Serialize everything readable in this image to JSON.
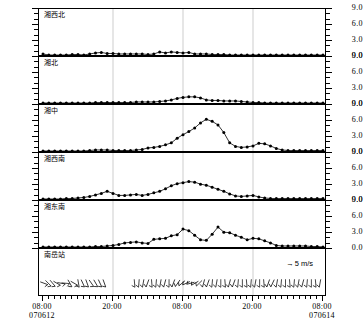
{
  "chart_data": {
    "type": "line",
    "title": "",
    "subtitle": "",
    "xlabel": "",
    "ylabel": "",
    "ylim": [
      0.0,
      9.0
    ],
    "yticks": [
      "0.0",
      "3.0",
      "6.0",
      "9.0"
    ],
    "grid": false,
    "legend_position": "panel-6-top-right",
    "x_tick_labels": [
      {
        "time": "08:00",
        "date": "070612"
      },
      {
        "time": "20:00",
        "date": ""
      },
      {
        "time": "08:00",
        "date": ""
      },
      {
        "time": "20:00",
        "date": ""
      },
      {
        "time": "08:00",
        "date": "070614"
      }
    ],
    "x_start": "070612 08:00",
    "x_end": "070614 08:00",
    "n_points": 49,
    "series": [
      {
        "name": "湘西北",
        "panel": 1,
        "values": [
          0.2,
          0.0,
          0.0,
          0.0,
          0.0,
          0.1,
          0.1,
          0.0,
          0.2,
          0.4,
          0.5,
          0.3,
          0.3,
          0.2,
          0.2,
          0.2,
          0.2,
          0.2,
          0.1,
          0.2,
          0.6,
          0.4,
          0.6,
          0.5,
          0.4,
          0.5,
          0.2,
          0.2,
          0.2,
          0.1,
          0.1,
          0.1,
          0.0,
          0.0,
          0.0,
          0.0,
          0.0,
          0.0,
          0.0,
          0.0,
          0.0,
          0.0,
          0.0,
          0.0,
          0.0,
          0.0,
          0.0,
          0.0,
          0.0
        ]
      },
      {
        "name": "湘北",
        "panel": 2,
        "values": [
          0.0,
          0.0,
          0.0,
          0.0,
          0.0,
          0.0,
          0.0,
          0.0,
          0.0,
          0.1,
          0.1,
          0.1,
          0.1,
          0.1,
          0.1,
          0.1,
          0.2,
          0.2,
          0.2,
          0.2,
          0.3,
          0.4,
          0.6,
          0.9,
          1.1,
          1.2,
          1.2,
          1.0,
          0.6,
          0.5,
          0.5,
          0.4,
          0.4,
          0.4,
          0.3,
          0.2,
          0.1,
          0.1,
          0.0,
          0.0,
          0.0,
          0.0,
          0.0,
          0.0,
          0.0,
          0.0,
          0.0,
          0.0,
          0.0
        ]
      },
      {
        "name": "湘中",
        "panel": 3,
        "values": [
          0.0,
          0.0,
          0.0,
          0.0,
          0.0,
          0.0,
          0.0,
          0.0,
          0.1,
          0.2,
          0.2,
          0.2,
          0.1,
          0.1,
          0.1,
          0.1,
          0.2,
          0.3,
          0.6,
          0.7,
          0.9,
          1.2,
          1.6,
          2.5,
          3.2,
          3.8,
          4.5,
          5.5,
          6.2,
          5.8,
          5.1,
          3.6,
          1.6,
          0.9,
          0.7,
          0.8,
          1.0,
          1.5,
          1.4,
          1.0,
          0.5,
          0.2,
          0.1,
          0.1,
          0.1,
          0.1,
          0.1,
          0.1,
          0.1
        ]
      },
      {
        "name": "湘西南",
        "panel": 4,
        "values": [
          0.0,
          0.0,
          0.0,
          0.0,
          0.1,
          0.1,
          0.2,
          0.3,
          0.5,
          0.8,
          1.1,
          1.5,
          1.1,
          0.7,
          0.7,
          0.8,
          0.9,
          0.7,
          0.9,
          1.2,
          1.5,
          2.0,
          2.6,
          3.0,
          3.2,
          3.4,
          3.3,
          2.9,
          2.7,
          2.3,
          1.9,
          1.5,
          1.0,
          0.6,
          0.5,
          0.6,
          0.7,
          0.4,
          0.2,
          0.1,
          0.1,
          0.1,
          0.1,
          0.1,
          0.1,
          0.1,
          0.1,
          0.1,
          0.1
        ]
      },
      {
        "name": "湘东南",
        "panel": 5,
        "values": [
          0.0,
          0.0,
          0.0,
          0.0,
          0.0,
          0.0,
          0.0,
          0.0,
          0.0,
          0.1,
          0.1,
          0.2,
          0.3,
          0.5,
          0.8,
          0.9,
          1.0,
          0.8,
          0.7,
          1.5,
          1.6,
          1.7,
          2.2,
          2.4,
          3.5,
          3.2,
          2.3,
          1.4,
          1.3,
          2.5,
          3.9,
          2.9,
          2.8,
          2.3,
          1.9,
          1.4,
          1.7,
          1.6,
          1.2,
          0.8,
          0.3,
          0.2,
          0.2,
          0.2,
          0.2,
          0.2,
          0.1,
          0.1,
          0.0
        ]
      }
    ],
    "wind_panel": {
      "name": "南岳站",
      "panel": 6,
      "legend_label": "5 m/s",
      "legend_icon": "right-arrow",
      "barb_level": 2.3,
      "directions_deg": [
        110,
        135,
        140,
        120,
        100,
        95,
        150,
        120,
        170,
        155,
        160,
        145,
        150,
        155,
        160,
        null,
        null,
        null,
        null,
        null,
        null,
        175,
        185,
        190,
        200,
        175,
        185,
        190,
        195,
        180,
        200,
        215,
        230,
        245,
        255,
        240,
        225,
        195,
        200,
        185,
        190,
        180,
        175,
        195,
        200,
        185,
        180,
        175,
        185,
        190,
        180,
        175,
        200,
        205,
        190,
        185,
        180,
        175,
        185,
        190,
        195,
        185,
        180,
        175,
        190
      ]
    }
  },
  "axis": {
    "y_labels": [
      "9.0",
      "6.0",
      "3.0",
      "0.0"
    ]
  }
}
